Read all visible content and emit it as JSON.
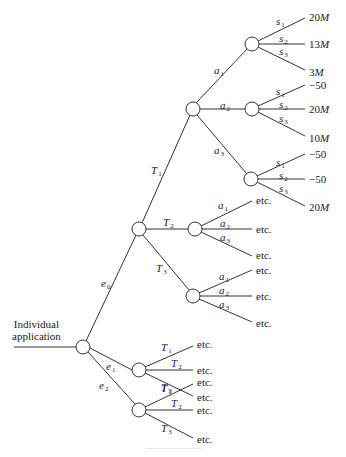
{
  "diagram": {
    "type": "decision-tree",
    "root_label_lines": [
      "Individual",
      "application"
    ],
    "nodes": [
      {
        "id": "root",
        "x": 83,
        "y": 347
      },
      {
        "id": "e0",
        "x": 139,
        "y": 229
      },
      {
        "id": "e1",
        "x": 139,
        "y": 370
      },
      {
        "id": "e2",
        "x": 139,
        "y": 410
      },
      {
        "id": "T1",
        "x": 193,
        "y": 109
      },
      {
        "id": "T2",
        "x": 195,
        "y": 229
      },
      {
        "id": "T3",
        "x": 193,
        "y": 296
      },
      {
        "id": "a1",
        "x": 252,
        "y": 44
      },
      {
        "id": "a2",
        "x": 252,
        "y": 109
      },
      {
        "id": "a3",
        "x": 251,
        "y": 179
      }
    ],
    "branches": {
      "root": [
        {
          "var": "e",
          "sub": "0",
          "to": "e0"
        },
        {
          "var": "e",
          "sub": "1",
          "to": "e1"
        },
        {
          "var": "e",
          "sub": "2",
          "to": "e2"
        }
      ],
      "e0": [
        {
          "var": "T",
          "sub": "1",
          "to": "T1"
        },
        {
          "var": "T",
          "sub": "2",
          "to": "T2"
        },
        {
          "var": "T",
          "sub": "3",
          "to": "T3"
        }
      ],
      "e1": [
        {
          "var": "T",
          "sub": "1",
          "outcome": "etc."
        },
        {
          "var": "T",
          "sub": "2",
          "outcome": "etc."
        },
        {
          "var": "T",
          "sub": "3",
          "outcome": "etc."
        }
      ],
      "e2": [
        {
          "var": "T",
          "sub": "1",
          "outcome": "etc."
        },
        {
          "var": "T",
          "sub": "2",
          "outcome": "etc."
        },
        {
          "var": "T",
          "sub": "3",
          "outcome": "etc."
        }
      ],
      "T1": [
        {
          "var": "a",
          "sub": "1",
          "to": "a1"
        },
        {
          "var": "a",
          "sub": "2",
          "to": "a2"
        },
        {
          "var": "a",
          "sub": "3",
          "to": "a3"
        }
      ],
      "T2": [
        {
          "var": "a",
          "sub": "1",
          "outcome": "etc."
        },
        {
          "var": "a",
          "sub": "2",
          "outcome": "etc."
        },
        {
          "var": "a",
          "sub": "3",
          "outcome": "etc."
        }
      ],
      "T3": [
        {
          "var": "a",
          "sub": "1",
          "outcome": "etc."
        },
        {
          "var": "a",
          "sub": "2",
          "outcome": "etc."
        },
        {
          "var": "a",
          "sub": "3",
          "outcome": "etc."
        }
      ],
      "a1": [
        {
          "var": "s",
          "sub": "1",
          "outcome": "20",
          "unit": "M"
        },
        {
          "var": "s",
          "sub": "2",
          "outcome": "13",
          "unit": "M"
        },
        {
          "var": "s",
          "sub": "3",
          "outcome": "3",
          "unit": "M"
        }
      ],
      "a2": [
        {
          "var": "s",
          "sub": "1",
          "outcome": "−50",
          "unit": ""
        },
        {
          "var": "s",
          "sub": "2",
          "outcome": "20",
          "unit": "M"
        },
        {
          "var": "s",
          "sub": "3",
          "outcome": "10",
          "unit": "M"
        }
      ],
      "a3": [
        {
          "var": "s",
          "sub": "1",
          "outcome": "−50",
          "unit": ""
        },
        {
          "var": "s",
          "sub": "2",
          "outcome": "−50",
          "unit": ""
        },
        {
          "var": "s",
          "sub": "3",
          "outcome": "20",
          "unit": "M"
        }
      ]
    },
    "colors": {
      "line": "#333333",
      "node_fill": "#ffffff",
      "text": "#222222"
    }
  }
}
